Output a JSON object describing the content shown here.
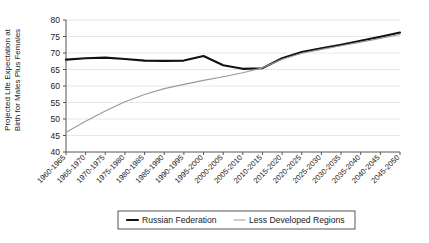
{
  "chart_data": {
    "type": "line",
    "title": "",
    "xlabel": "",
    "ylabel_line1": "Projected Life Expectation at",
    "ylabel_line2": "Birth for Males Plus Females",
    "ylim": [
      40,
      80
    ],
    "yticks": [
      40,
      45,
      50,
      55,
      60,
      65,
      70,
      75,
      80
    ],
    "grid": true,
    "legend_position": "bottom",
    "categories": [
      "1960-1965",
      "1965-1970",
      "1970-1975",
      "1975-1980",
      "1980-1985",
      "1985-1990",
      "1990-1995",
      "1995-2000",
      "2000-2005",
      "2005-2010",
      "2010-2015",
      "2015-2020",
      "2020-2025",
      "2025-2030",
      "2030-2035",
      "2035-2040",
      "2040-2045",
      "2045-2050"
    ],
    "series": [
      {
        "name": "Russian Federation",
        "color": "#111111",
        "width": 2.1,
        "values": [
          68.0,
          68.4,
          68.6,
          68.2,
          67.7,
          67.6,
          67.7,
          69.1,
          66.3,
          65.2,
          65.4,
          68.4,
          70.3,
          71.4,
          72.5,
          73.7,
          74.9,
          76.2
        ]
      },
      {
        "name": "Less Developed Regions",
        "color": "#9a9a9a",
        "width": 1.1,
        "values": [
          46.0,
          49.3,
          52.4,
          55.2,
          57.4,
          59.2,
          60.5,
          61.7,
          62.8,
          64.0,
          65.5,
          68.1,
          69.9,
          71.1,
          72.2,
          73.3,
          74.4,
          75.6
        ]
      }
    ]
  },
  "legend": {
    "entries": [
      {
        "label": "Russian Federation"
      },
      {
        "label": "Less Developed Regions"
      }
    ]
  }
}
